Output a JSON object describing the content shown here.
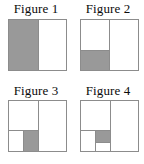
{
  "figures": [
    {
      "label": "Figure 1",
      "description": "Square divided into two vertical halves; left half shaded gray, right half white.",
      "shaded_fraction": "1/2"
    },
    {
      "label": "Figure 2",
      "description": "Square divided into two vertical halves; left half split horizontally with its lower portion shaded gray.",
      "shaded_fraction": "1/4"
    },
    {
      "label": "Figure 3",
      "description": "Square divided into two vertical halves; left half split horizontally, its lower portion split vertically with the right part shaded gray.",
      "shaded_fraction": "1/8"
    },
    {
      "label": "Figure 4",
      "description": "Square divided into two vertical halves; left half split horizontally, its lower portion split vertically and again horizontally with the upper-right small part shaded gray.",
      "shaded_fraction": "1/16"
    }
  ],
  "colors": {
    "shade": "#999999",
    "line": "#8c8c8c",
    "background": "#ffffff",
    "text": "#0b0b0b"
  }
}
